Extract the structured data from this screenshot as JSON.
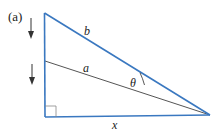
{
  "figure": {
    "panel_label": "(a)",
    "colors": {
      "triangle": "#3a78c0",
      "inner_line": "#555555",
      "arrows": "#333333",
      "text": "#222222"
    },
    "labels": {
      "hypotenuse": "b",
      "inner_segment": "a",
      "angle": "θ",
      "base": "x"
    },
    "arrows": [
      {
        "direction": "down",
        "description": "upper downward arrow"
      },
      {
        "direction": "down",
        "description": "lower downward arrow"
      }
    ],
    "right_angle_marker": true
  }
}
